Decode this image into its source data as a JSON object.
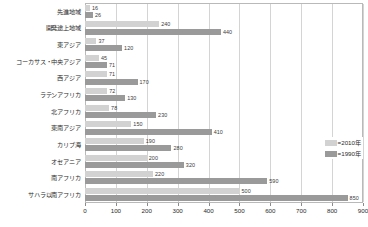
{
  "chart_data": {
    "type": "bar",
    "orientation": "horizontal",
    "title": "",
    "xlabel": "",
    "ylabel": "",
    "xlim": [
      0,
      900
    ],
    "xticks": [
      0,
      100,
      200,
      300,
      400,
      500,
      600,
      700,
      800,
      900
    ],
    "grid": true,
    "legend_position": "bottom-right",
    "categories": [
      "先進地域",
      "開発途上地域",
      "東アジア",
      "コーカサス・中央アジア",
      "西アジア",
      "ラテンアフリカ",
      "北アフリカ",
      "東南アジア",
      "カリブ海",
      "オセアニア",
      "南アフリカ",
      "サハラ以南アフリカ"
    ],
    "series": [
      {
        "name": "2010年",
        "color": "#d2d2d2",
        "values": [
          16,
          240,
          37,
          45,
          71,
          72,
          78,
          150,
          190,
          200,
          220,
          500
        ]
      },
      {
        "name": "1990年",
        "color": "#9a9a9a",
        "values": [
          26,
          440,
          120,
          71,
          170,
          130,
          230,
          410,
          280,
          320,
          590,
          850
        ]
      }
    ]
  },
  "legend": {
    "items": [
      {
        "label": "=2010年",
        "series": "2010年"
      },
      {
        "label": "=1990年",
        "series": "1990年"
      }
    ]
  }
}
